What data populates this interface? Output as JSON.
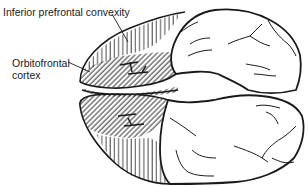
{
  "diagram": {
    "labels": [
      {
        "id": "inferior-prefrontal-convexity",
        "lines": [
          "Inferior prefrontal convexity"
        ],
        "pattern": "vertical-hatch"
      },
      {
        "id": "orbitofrontal-cortex",
        "lines": [
          "Orbitofrontal",
          "cortex"
        ],
        "pattern": "diagonal-hatch"
      }
    ],
    "colors": {
      "stroke": "#1a1a1a",
      "fill": "#ffffff",
      "text": "#1a1a1a"
    }
  }
}
